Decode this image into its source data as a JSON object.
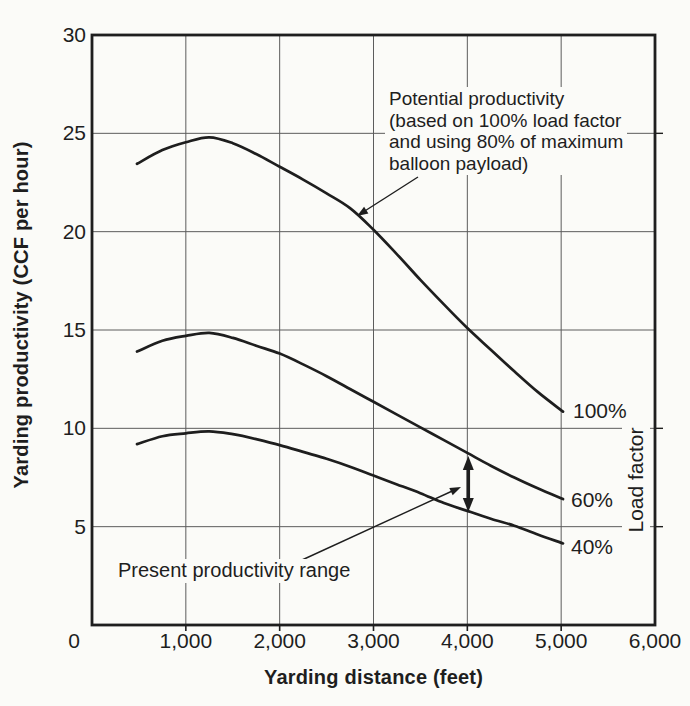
{
  "colors": {
    "background": "#fbfbf8",
    "ink": "#1e1e1e",
    "grid": "#5c5c5c"
  },
  "chart_data": {
    "type": "line",
    "title": "",
    "xlabel": "Yarding distance (feet)",
    "ylabel": "Yarding productivity (CCF per hour)",
    "right_axis_label": "Load factor",
    "xlim": [
      0,
      6000
    ],
    "ylim": [
      0,
      30
    ],
    "grid": true,
    "x_ticks": [
      {
        "value": 0,
        "label": "0"
      },
      {
        "value": 1000,
        "label": "1,000"
      },
      {
        "value": 2000,
        "label": "2,000"
      },
      {
        "value": 3000,
        "label": "3,000"
      },
      {
        "value": 4000,
        "label": "4,000"
      },
      {
        "value": 5000,
        "label": "5,000"
      },
      {
        "value": 6000,
        "label": "6,000"
      }
    ],
    "y_ticks": [
      {
        "value": 5,
        "label": "5"
      },
      {
        "value": 10,
        "label": "10"
      },
      {
        "value": 15,
        "label": "15"
      },
      {
        "value": 20,
        "label": "20"
      },
      {
        "value": 25,
        "label": "25"
      },
      {
        "value": 30,
        "label": "30"
      }
    ],
    "series": [
      {
        "name": "Potential productivity at 100% load factor",
        "label": "100%",
        "points": [
          [
            480,
            23.45
          ],
          [
            750,
            24.15
          ],
          [
            1000,
            24.55
          ],
          [
            1250,
            24.8
          ],
          [
            1500,
            24.5
          ],
          [
            1750,
            23.95
          ],
          [
            2000,
            23.3
          ],
          [
            2250,
            22.65
          ],
          [
            2500,
            21.95
          ],
          [
            2750,
            21.2
          ],
          [
            3000,
            20.1
          ],
          [
            3250,
            18.85
          ],
          [
            3500,
            17.55
          ],
          [
            3750,
            16.3
          ],
          [
            4000,
            15.1
          ],
          [
            4250,
            14.0
          ],
          [
            4500,
            12.9
          ],
          [
            4750,
            11.85
          ],
          [
            5020,
            10.85
          ]
        ]
      },
      {
        "name": "Productivity at 60% load factor",
        "label": "60%",
        "points": [
          [
            480,
            13.9
          ],
          [
            750,
            14.45
          ],
          [
            1000,
            14.7
          ],
          [
            1250,
            14.85
          ],
          [
            1500,
            14.6
          ],
          [
            1750,
            14.2
          ],
          [
            2000,
            13.8
          ],
          [
            2250,
            13.25
          ],
          [
            2500,
            12.65
          ],
          [
            2750,
            12.0
          ],
          [
            3000,
            11.35
          ],
          [
            3250,
            10.7
          ],
          [
            3500,
            10.05
          ],
          [
            3750,
            9.4
          ],
          [
            4000,
            8.75
          ],
          [
            4250,
            8.1
          ],
          [
            4500,
            7.5
          ],
          [
            4750,
            6.95
          ],
          [
            5020,
            6.4
          ]
        ]
      },
      {
        "name": "Productivity at 40% load factor",
        "label": "40%",
        "points": [
          [
            480,
            9.2
          ],
          [
            750,
            9.6
          ],
          [
            1000,
            9.75
          ],
          [
            1250,
            9.85
          ],
          [
            1500,
            9.7
          ],
          [
            1750,
            9.45
          ],
          [
            2000,
            9.15
          ],
          [
            2250,
            8.8
          ],
          [
            2500,
            8.45
          ],
          [
            2750,
            8.05
          ],
          [
            3000,
            7.6
          ],
          [
            3250,
            7.15
          ],
          [
            3500,
            6.7
          ],
          [
            3750,
            6.2
          ],
          [
            4000,
            5.8
          ],
          [
            4250,
            5.4
          ],
          [
            4500,
            5.05
          ],
          [
            4750,
            4.6
          ],
          [
            5020,
            4.15
          ]
        ]
      }
    ],
    "annotations": [
      {
        "id": "potential-productivity",
        "text": "Potential productivity\n(based on 100% load factor\nand using 80% of maximum\nballoon payload)",
        "arrow_target": {
          "x": 2835,
          "y": 20.8
        }
      },
      {
        "id": "present-productivity-range",
        "text": "Present productivity range",
        "arrow_target": {
          "x": 3935,
          "y": 7.0
        }
      },
      {
        "id": "productivity-range-arrow",
        "type": "vertical-double-arrow",
        "x": 4010,
        "y_from": 5.75,
        "y_to": 8.6
      }
    ]
  }
}
